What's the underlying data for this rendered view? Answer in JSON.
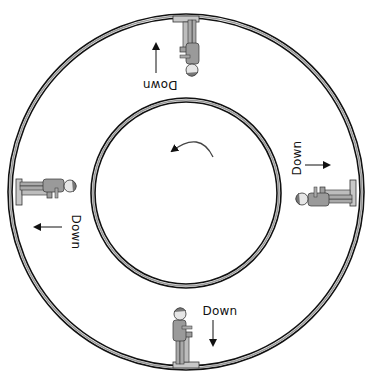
{
  "diagram": {
    "rotation_direction": "counterclockwise",
    "outer_ring": {
      "cx": 186,
      "cy": 192,
      "r": 176
    },
    "inner_ring": {
      "cx": 186,
      "cy": 193,
      "r": 93
    },
    "colors": {
      "ring_dark": "#111111",
      "ring_light": "#9a9a9a",
      "figure_fill": "#b8b8b8",
      "figure_stroke": "#333333",
      "text": "#111111"
    },
    "stations": [
      {
        "position": "top",
        "label": "Down",
        "arrow_direction": "up"
      },
      {
        "position": "right",
        "label": "Down",
        "arrow_direction": "right"
      },
      {
        "position": "left",
        "label": "Down",
        "arrow_direction": "left"
      },
      {
        "position": "bottom",
        "label": "Down",
        "arrow_direction": "down"
      }
    ]
  }
}
